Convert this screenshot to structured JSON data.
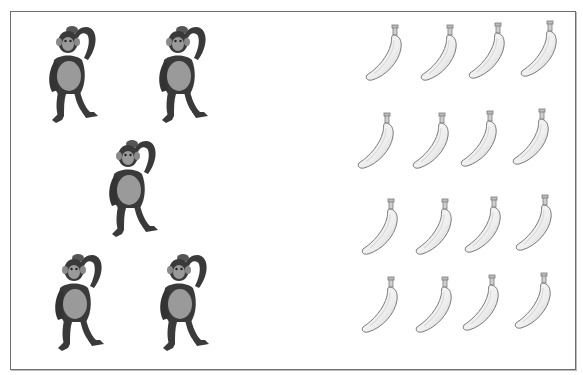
{
  "worksheet": {
    "type": "counting-comparison",
    "left_group": {
      "object": "chimpanzee",
      "icon": "chimpanzee-icon",
      "count": 5,
      "positions": [
        {
          "x": 44,
          "y": 20
        },
        {
          "x": 154,
          "y": 20
        },
        {
          "x": 104,
          "y": 134
        },
        {
          "x": 50,
          "y": 248
        },
        {
          "x": 155,
          "y": 248
        }
      ]
    },
    "right_group": {
      "object": "banana",
      "icon": "banana-icon",
      "count": 16,
      "rows": 4,
      "columns": 4,
      "positions": [
        {
          "x": 364,
          "y": 24
        },
        {
          "x": 419,
          "y": 24
        },
        {
          "x": 467,
          "y": 22
        },
        {
          "x": 519,
          "y": 20
        },
        {
          "x": 356,
          "y": 112
        },
        {
          "x": 411,
          "y": 112
        },
        {
          "x": 459,
          "y": 110
        },
        {
          "x": 511,
          "y": 108
        },
        {
          "x": 360,
          "y": 198
        },
        {
          "x": 414,
          "y": 198
        },
        {
          "x": 463,
          "y": 196
        },
        {
          "x": 514,
          "y": 194
        },
        {
          "x": 360,
          "y": 276
        },
        {
          "x": 414,
          "y": 276
        },
        {
          "x": 461,
          "y": 274
        },
        {
          "x": 513,
          "y": 272
        }
      ]
    },
    "colors": {
      "border": "#6e6e6e",
      "chimp_fur": "#3a3a3a",
      "chimp_skin": "#9a9a9a",
      "banana_fill": "#f4f4f4",
      "banana_outline": "#7a7a7a"
    }
  }
}
